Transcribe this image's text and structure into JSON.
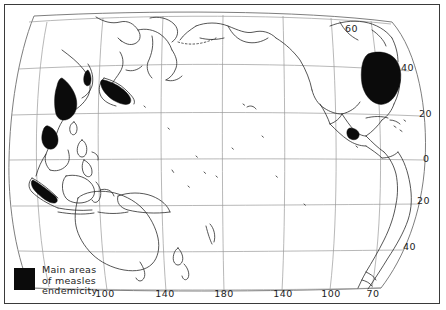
{
  "map": {
    "title": "Main areas of measles endemicity",
    "projection": "pacific-centered-world",
    "frame_color": "#3a3a3a",
    "coast_color": "#2b2b2b",
    "graticule_color": "#9a9a9a",
    "endemic_color": "#0b0b0b",
    "longitude_labels": [
      {
        "text": "100",
        "x": 105,
        "y": 297
      },
      {
        "text": "140",
        "x": 165,
        "y": 297
      },
      {
        "text": "180",
        "x": 224,
        "y": 297
      },
      {
        "text": "140",
        "x": 283,
        "y": 297
      },
      {
        "text": "100",
        "x": 331,
        "y": 297
      },
      {
        "text": "70",
        "x": 373,
        "y": 297
      }
    ],
    "latitude_labels": [
      {
        "text": "60",
        "x": 345,
        "y": 32
      },
      {
        "text": "40",
        "x": 401,
        "y": 71
      },
      {
        "text": "20",
        "x": 419,
        "y": 117
      },
      {
        "text": "0",
        "x": 423,
        "y": 162
      },
      {
        "text": "20",
        "x": 417,
        "y": 204
      },
      {
        "text": "40",
        "x": 403,
        "y": 250
      }
    ],
    "endemic_regions": [
      "east-china-coast",
      "southern-japan",
      "vietnam-indochina",
      "sumatra-java",
      "northeast-united-states",
      "southern-mexico"
    ]
  },
  "legend": {
    "swatch_color": "#0b0b0b",
    "line1": "Main areas",
    "line2": "of measles",
    "line3": "endemicity"
  }
}
